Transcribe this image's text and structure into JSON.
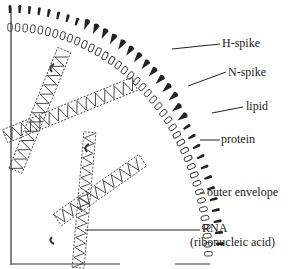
{
  "diagram": {
    "colors": {
      "ink": "#1a1a1a",
      "background": "#ffffff"
    },
    "labels": [
      {
        "id": "h-spike",
        "text": "H-spike",
        "x": 222,
        "y": 37,
        "line_from": [
          172,
          49
        ],
        "line_to": [
          220,
          44
        ]
      },
      {
        "id": "n-spike",
        "text": "N-spike",
        "x": 228,
        "y": 66,
        "line_from": [
          188,
          86
        ],
        "line_to": [
          226,
          72
        ]
      },
      {
        "id": "lipid",
        "text": "lipid",
        "x": 246,
        "y": 100,
        "line_from": [
          212,
          113
        ],
        "line_to": [
          243,
          107
        ]
      },
      {
        "id": "protein",
        "text": "protein",
        "x": 221,
        "y": 131,
        "line_from": [
          200,
          140
        ],
        "line_to": [
          220,
          140
        ]
      },
      {
        "id": "outer-envelope",
        "text": "outer envelope",
        "x": 207,
        "y": 186,
        "line_from": [
          200,
          193
        ],
        "line_to": [
          205,
          193
        ]
      },
      {
        "id": "rna",
        "text": "RNA",
        "x": 202,
        "y": 221,
        "line_from": [
          85,
          230
        ],
        "line_to": [
          200,
          230
        ]
      },
      {
        "id": "rna-full",
        "text": "(ribonucleic acid)",
        "x": 190,
        "y": 236
      }
    ]
  }
}
